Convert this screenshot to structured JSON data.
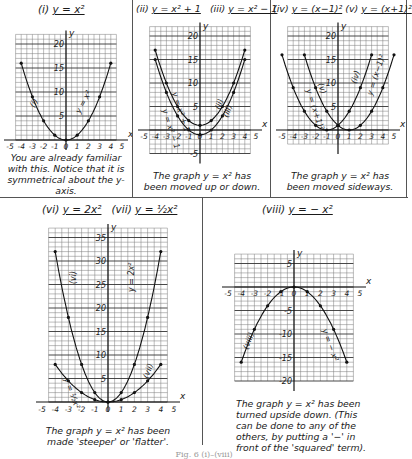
{
  "figure_caption": "Fig. 6 (i)–(viii)",
  "panels": [
    {
      "id": "i",
      "title_num": "(i)",
      "title_eq": "y = x²",
      "caption": "You are already familiar with this. Notice that it is symmetrical about the y-axis.",
      "curve_labels": [
        "(i)",
        "y = x²"
      ]
    },
    {
      "id": "ii-iii",
      "title_num": "(ii)",
      "title_eq": "y = x² + 1",
      "title_num2": "(iii)",
      "title_eq2": "y = x² − 1",
      "caption": "The graph y = x² has been moved up or down.",
      "curve_labels": [
        "y = x² + 1",
        "y = x² − 1",
        "(ii)",
        "(iii)"
      ]
    },
    {
      "id": "iv-v",
      "title_num": "(iv)",
      "title_eq": "y = (x−1)²",
      "title_num2": "(v)",
      "title_eq2": "y = (x+1)²",
      "caption": "The graph y = x² has been moved sideways.",
      "curve_labels": [
        "y = (x+1)²",
        "(v)",
        "(iv)",
        "y = (x−1)²"
      ]
    },
    {
      "id": "vi-vii",
      "title_num": "(vi)",
      "title_eq": "y = 2x²",
      "title_num2": "(vii)",
      "title_eq2": "y = ½x²",
      "caption": "The graph y = x² has been made 'steeper' or 'flatter'.",
      "curve_labels": [
        "(vi)",
        "y = 2x²",
        "y = ½x²",
        "(vii)"
      ]
    },
    {
      "id": "viii",
      "title_num": "(viii)",
      "title_eq": "y = − x²",
      "caption": "The graph y = x² has been turned upside down. (This can be done to any of the others, by putting a '−' in front of the 'squared' term).",
      "curve_labels": [
        "(viii)",
        "y = − x²"
      ]
    }
  ],
  "chart_data": [
    {
      "type": "line",
      "title": "(i) y = x²",
      "xlabel": "x",
      "ylabel": "y",
      "xlim": [
        -5,
        5
      ],
      "ylim": [
        0,
        22
      ],
      "xticks": [
        -5,
        -4,
        -3,
        -2,
        -1,
        0,
        1,
        2,
        3,
        4,
        5
      ],
      "yticks": [
        5,
        10,
        15,
        20
      ],
      "grid": true,
      "series": [
        {
          "name": "y = x²",
          "x": [
            -4,
            -3,
            -2,
            -1,
            0,
            1,
            2,
            3,
            4
          ],
          "y": [
            16,
            9,
            4,
            1,
            0,
            1,
            4,
            9,
            16
          ]
        }
      ]
    },
    {
      "type": "line",
      "title": "(ii) y = x²+1, (iii) y = x²−1",
      "xlabel": "x",
      "ylabel": "y",
      "xlim": [
        -5,
        5
      ],
      "ylim": [
        -5,
        22
      ],
      "xticks": [
        -5,
        -4,
        -3,
        -2,
        -1,
        0,
        1,
        2,
        3,
        4,
        5
      ],
      "yticks": [
        -5,
        5,
        10,
        15,
        20
      ],
      "grid": true,
      "series": [
        {
          "name": "y = x² + 1",
          "x": [
            -4,
            -3,
            -2,
            -1,
            0,
            1,
            2,
            3,
            4
          ],
          "y": [
            17,
            10,
            5,
            2,
            1,
            2,
            5,
            10,
            17
          ]
        },
        {
          "name": "y = x² − 1",
          "x": [
            -4,
            -3,
            -2,
            -1,
            0,
            1,
            2,
            3,
            4
          ],
          "y": [
            15,
            8,
            3,
            0,
            -1,
            0,
            3,
            8,
            15
          ]
        }
      ]
    },
    {
      "type": "line",
      "title": "(iv) y = (x−1)², (v) y = (x+1)²",
      "xlabel": "x",
      "ylabel": "y",
      "xlim": [
        -5,
        5
      ],
      "ylim": [
        -3,
        22
      ],
      "xticks": [
        -5,
        -4,
        -3,
        -2,
        -1,
        0,
        1,
        2,
        3,
        4,
        5
      ],
      "yticks": [
        5,
        10,
        15,
        20
      ],
      "grid": true,
      "series": [
        {
          "name": "y = (x−1)²",
          "x": [
            -3,
            -2,
            -1,
            0,
            1,
            2,
            3,
            4,
            5
          ],
          "y": [
            16,
            9,
            4,
            1,
            0,
            1,
            4,
            9,
            16
          ]
        },
        {
          "name": "y = (x+1)²",
          "x": [
            -5,
            -4,
            -3,
            -2,
            -1,
            0,
            1,
            2,
            3
          ],
          "y": [
            16,
            9,
            4,
            1,
            0,
            1,
            4,
            9,
            16
          ]
        }
      ]
    },
    {
      "type": "line",
      "title": "(vi) y = 2x², (vii) y = ½x²",
      "xlabel": "x",
      "ylabel": "y",
      "xlim": [
        -5,
        5
      ],
      "ylim": [
        0,
        37
      ],
      "xticks": [
        -5,
        -4,
        -3,
        -2,
        -1,
        0,
        1,
        2,
        3,
        4,
        5
      ],
      "yticks": [
        5,
        10,
        15,
        20,
        25,
        30,
        35
      ],
      "grid": true,
      "series": [
        {
          "name": "y = 2x²",
          "x": [
            -4,
            -3,
            -2,
            -1,
            0,
            1,
            2,
            3,
            4
          ],
          "y": [
            32,
            18,
            8,
            2,
            0,
            2,
            8,
            18,
            32
          ]
        },
        {
          "name": "y = ½x²",
          "x": [
            -4,
            -3,
            -2,
            -1,
            0,
            1,
            2,
            3,
            4
          ],
          "y": [
            8,
            4.5,
            2,
            0.5,
            0,
            0.5,
            2,
            4.5,
            8
          ]
        }
      ]
    },
    {
      "type": "line",
      "title": "(viii) y = −x²",
      "xlabel": "x",
      "ylabel": "y",
      "xlim": [
        -5,
        5
      ],
      "ylim": [
        -22,
        7
      ],
      "xticks": [
        -5,
        -4,
        -3,
        -2,
        -1,
        0,
        1,
        2,
        3,
        4,
        5
      ],
      "yticks": [
        5,
        -5,
        -10,
        -15,
        -20
      ],
      "grid": true,
      "series": [
        {
          "name": "y = −x²",
          "x": [
            -4,
            -3,
            -2,
            -1,
            0,
            1,
            2,
            3,
            4
          ],
          "y": [
            -16,
            -9,
            -4,
            -1,
            0,
            -1,
            -4,
            -9,
            -16
          ]
        }
      ]
    }
  ]
}
